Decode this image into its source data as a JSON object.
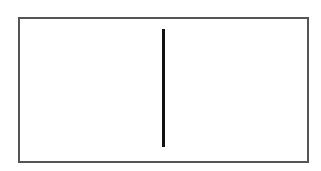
{
  "diagram": {
    "frame": {
      "shape": "rectangle",
      "stroke_color": "#555555",
      "fill_color": "#ffffff"
    },
    "divider": {
      "shape": "vertical-line",
      "stroke_color": "#111111"
    }
  }
}
